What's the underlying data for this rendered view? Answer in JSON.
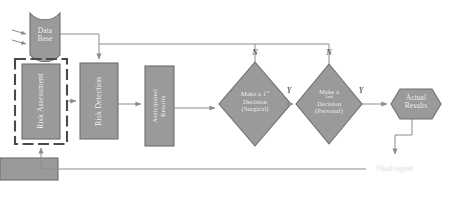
{
  "diagram": {
    "type": "flowchart",
    "colors": {
      "node_fill": "#9a9a9a",
      "node_stroke": "#6e6e6e",
      "node_text": "#ffffff",
      "connector": "#8d8d8d",
      "dashed_frame": "#4a4a4a",
      "background": "#ffffff",
      "edge_label": "#2b2b2b"
    },
    "nodes": [
      {
        "id": "database",
        "shape": "cylinder",
        "label_line1": "Data",
        "label_line2": "Base",
        "text": "Data Base"
      },
      {
        "id": "risk-assessment",
        "shape": "rectangle",
        "text": "Risk Assessment",
        "orientation": "vertical",
        "framed": true
      },
      {
        "id": "risk-detection",
        "shape": "rectangle",
        "text": "Risk Detection",
        "orientation": "vertical"
      },
      {
        "id": "anticipated-results",
        "shape": "rectangle",
        "text_line1": "Anticipated",
        "text_line2": "Results",
        "orientation": "vertical"
      },
      {
        "id": "decision-1",
        "shape": "diamond",
        "text_line1": "Make a 1",
        "text_sup": "st",
        "text_line2": "Decision",
        "text_line3": "(Surgical)"
      },
      {
        "id": "decision-2",
        "shape": "diamond",
        "text_line1": "Make a",
        "text_sup": "2nd",
        "text_line2": "Decision",
        "text_line3": "(Personal)"
      },
      {
        "id": "actual-results",
        "shape": "hexagon",
        "text_line1": "Actual",
        "text_line2": "Results"
      },
      {
        "id": "final-report",
        "shape": "rectangle",
        "text": "Final report"
      }
    ],
    "edge_labels": {
      "decision1_no": "N",
      "decision2_no": "N",
      "decision1_yes": "Y",
      "decision2_yes": "Y"
    },
    "edges": [
      {
        "from": "database",
        "to": "risk-detection",
        "label": ""
      },
      {
        "from": "risk-assessment",
        "to": "risk-detection",
        "label": ""
      },
      {
        "from": "risk-detection",
        "to": "anticipated-results",
        "label": ""
      },
      {
        "from": "anticipated-results",
        "to": "decision-1",
        "label": ""
      },
      {
        "from": "decision-1",
        "to": "decision-2",
        "label": "Y"
      },
      {
        "from": "decision-2",
        "to": "actual-results",
        "label": "Y"
      },
      {
        "from": "decision-1",
        "to": "risk-detection",
        "label": "N"
      },
      {
        "from": "decision-2",
        "to": "risk-detection",
        "label": "N"
      },
      {
        "from": "actual-results",
        "to": "final-report",
        "label": ""
      },
      {
        "from": "final-report",
        "to": "risk-assessment",
        "label": ""
      },
      {
        "from": "external-input",
        "to": "database",
        "label": ""
      }
    ]
  }
}
